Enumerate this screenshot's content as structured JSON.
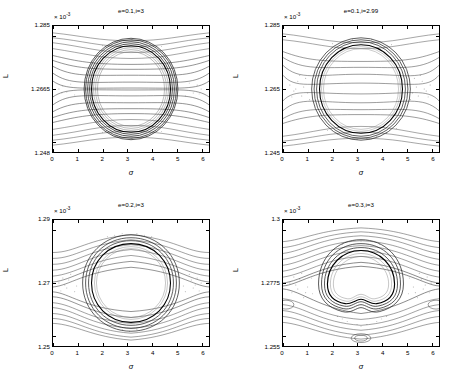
{
  "figure": {
    "kind": "poincare-section-grid",
    "rows": 2,
    "cols": 2,
    "exponent_label": "× 10",
    "exponent_sup": "-3",
    "xlabel": "σ",
    "ylabel": "L"
  },
  "chart_data": [
    {
      "id": "panel-top-left",
      "type": "scatter",
      "title": "e=0.1,i=3",
      "xlabel": "σ",
      "ylabel": "L",
      "y_exponent": "×10^-3",
      "xlim": [
        0,
        6.2832
      ],
      "ylim": [
        1.248,
        1.285
      ],
      "xticks": [
        0,
        1,
        2,
        3,
        4,
        5,
        6
      ],
      "xticklabels": [
        "0",
        "1",
        "2",
        "3",
        "4",
        "5",
        "6"
      ],
      "yticks": [
        1.248,
        1.2665,
        1.285
      ],
      "yticklabels": [
        "1.248",
        "1.2665",
        "1.285"
      ],
      "grid": false,
      "legend": "none",
      "description": "Phase-space Poincare surface of section. Large empty central island spanning sigma ~1.3 to ~4.9 centered at sigma=pi, L~1.2665e-3. Island is bounded by a thick dark chaotic/stochastic separatrix annulus. Lateral chaotic lobes narrow toward sigma=0 and sigma=2pi at mid-height L~1.2665e-3. Smooth circulating invariant curves sweep across above and below the separatrix.",
      "island_center": [
        3.1416,
        1.2665
      ],
      "island_half_width_sigma": 1.8,
      "island_half_height_L": 0.0135,
      "separatrix_thickness": 0.0022,
      "n_outer_curves_top": 6,
      "n_outer_curves_bottom": 6
    },
    {
      "id": "panel-top-right",
      "type": "scatter",
      "title": "e=0.1,i=2.99",
      "xlabel": "σ",
      "ylabel": "L",
      "y_exponent": "×10^-3",
      "xlim": [
        0,
        6.2832
      ],
      "ylim": [
        1.245,
        1.285
      ],
      "xticks": [
        0,
        1,
        2,
        3,
        4,
        5,
        6
      ],
      "xticklabels": [
        "0",
        "1",
        "2",
        "3",
        "4",
        "5",
        "6"
      ],
      "yticks": [
        1.245,
        1.265,
        1.285
      ],
      "yticklabels": [
        "1.245",
        "1.265",
        "1.285"
      ],
      "grid": false,
      "legend": "none",
      "description": "Similar Poincare section with a wider, more diffuse stochastic band. Central empty island is rounder and slightly larger, centered at sigma=pi, L~1.2665e-3. Heavy speckled chaotic scatter fills the left and right flanks near sigma=0.3-1.3 and sigma=5.0-6.0 and along the lower separatrix. Few smooth curves remain at the extreme top and bottom.",
      "island_center": [
        3.1416,
        1.2665
      ],
      "island_half_width_sigma": 1.9,
      "island_half_height_L": 0.0155,
      "separatrix_thickness": 0.0035,
      "n_outer_curves_top": 4,
      "n_outer_curves_bottom": 4
    },
    {
      "id": "panel-bottom-left",
      "type": "scatter",
      "title": "e=0.2,i=3",
      "xlabel": "σ",
      "ylabel": "L",
      "y_exponent": "×10^-3",
      "xlim": [
        0,
        6.2832
      ],
      "ylim": [
        1.25,
        1.29
      ],
      "xticks": [
        0,
        1,
        2,
        3,
        4,
        5,
        6
      ],
      "xticklabels": [
        "0",
        "1",
        "2",
        "3",
        "4",
        "5",
        "6"
      ],
      "yticks": [
        1.25,
        1.27,
        1.29
      ],
      "yticklabels": [
        "1.25",
        "1.27",
        "1.29"
      ],
      "grid": false,
      "legend": "none",
      "description": "Poincare section for larger eccentricity. Central island is squarer/flattened on top, touching the upper axis limit near L=1.289e-3 around sigma=pi. Broad chaotic layer wraps the island and spreads into the left and right corners. Several smooth nested circulation curves appear in the upper-left, upper-right and lower band.",
      "island_center": [
        3.1416,
        1.2705
      ],
      "island_half_width_sigma": 2.0,
      "island_half_height_L": 0.0175,
      "separatrix_thickness": 0.0032,
      "n_outer_curves_top": 5,
      "n_outer_curves_bottom": 5
    },
    {
      "id": "panel-bottom-right",
      "type": "scatter",
      "title": "e=0.3,i=3",
      "xlabel": "σ",
      "ylabel": "L",
      "y_exponent": "×10^-3",
      "xlim": [
        0,
        6.2832
      ],
      "ylim": [
        1.255,
        1.3
      ],
      "xticks": [
        0,
        1,
        2,
        3,
        4,
        5,
        6
      ],
      "xticklabels": [
        "0",
        "1",
        "2",
        "3",
        "4",
        "5",
        "6"
      ],
      "yticks": [
        1.255,
        1.2775,
        1.3
      ],
      "yticklabels": [
        "1.255",
        "1.2775",
        "1.3"
      ],
      "grid": false,
      "legend": "none",
      "description": "Poincare section for e=0.3. Central empty island is pentagon-like with a dimple at the bottom near sigma=pi. Thick multi-strand separatrix of dark curves surrounds it. Chaotic speckle concentrated on left and right flanks. Secondary small islands visible at lower-left and lower-right edges (sigma~0.1 and sigma~6.2, L~1.262e-3) and a small island chain at the bottom centre near sigma=pi, L~1.2565e-3.",
      "island_center": [
        3.1416,
        1.2775
      ],
      "island_half_width_sigma": 1.75,
      "island_half_height_L": 0.0145,
      "separatrix_thickness": 0.004,
      "n_outer_curves_top": 7,
      "n_outer_curves_bottom": 6,
      "secondary_islands": [
        {
          "sigma": 0.08,
          "L": 1.2625
        },
        {
          "sigma": 6.22,
          "L": 1.2625
        },
        {
          "sigma": 3.1416,
          "L": 1.2565
        }
      ]
    }
  ]
}
